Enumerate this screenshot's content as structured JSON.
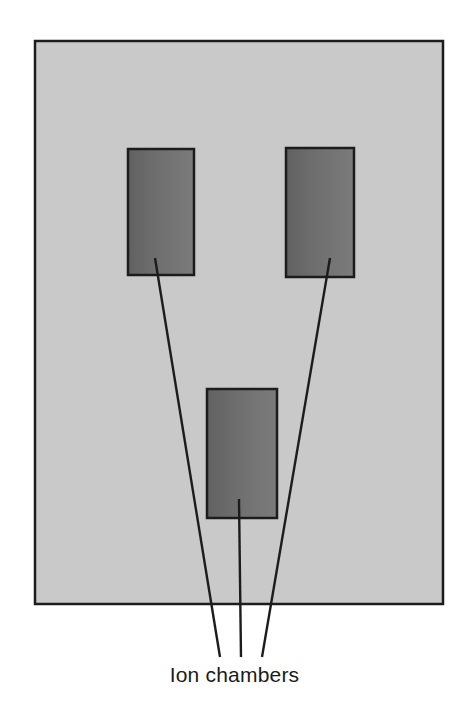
{
  "figure": {
    "kind": "technical-schematic",
    "title_visible": false,
    "canvas": {
      "width": 469,
      "height": 718,
      "background": "#ffffff"
    },
    "caption": {
      "text": "Ion chambers",
      "x": 234,
      "y": 663,
      "font_size": 21,
      "color": "#1a1a1a",
      "align": "center"
    },
    "outer_panel": {
      "name": "housing-panel",
      "x": 35,
      "y": 41,
      "width": 408,
      "height": 563,
      "fill": "#c9c9c9",
      "stroke": "#1c1c1c",
      "stroke_width": 2.5
    },
    "chambers": [
      {
        "label": "upper-left-chamber",
        "x": 128,
        "y": 149,
        "width": 66,
        "height": 126,
        "fill_dark": "#616161",
        "fill_light": "#7b7b7b",
        "stroke": "#1c1c1c",
        "stroke_width": 2.5
      },
      {
        "label": "upper-right-chamber",
        "x": 286,
        "y": 148,
        "width": 68,
        "height": 129,
        "fill_dark": "#616161",
        "fill_light": "#7b7b7b",
        "stroke": "#1c1c1c",
        "stroke_width": 2.5
      },
      {
        "label": "lower-center-chamber",
        "x": 207,
        "y": 389,
        "width": 70,
        "height": 129,
        "fill_dark": "#616161",
        "fill_light": "#7b7b7b",
        "stroke": "#1c1c1c",
        "stroke_width": 2.5
      }
    ],
    "leader_lines": [
      {
        "label": "leader-line-left",
        "from_x": 155,
        "from_y": 258,
        "to_x": 220,
        "to_y": 657,
        "stroke": "#1c1c1c",
        "stroke_width": 2.4
      },
      {
        "label": "leader-line-center",
        "from_x": 239,
        "from_y": 499,
        "to_x": 241,
        "to_y": 657,
        "stroke": "#1c1c1c",
        "stroke_width": 2.4
      },
      {
        "label": "leader-line-right",
        "from_x": 330,
        "from_y": 258,
        "to_x": 262,
        "to_y": 657,
        "stroke": "#1c1c1c",
        "stroke_width": 2.4
      }
    ]
  }
}
